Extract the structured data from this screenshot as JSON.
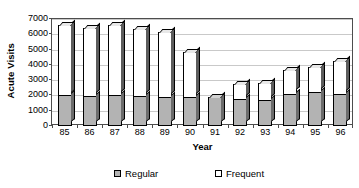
{
  "chart_data": {
    "type": "bar",
    "subtype": "stacked-column-3d",
    "title": "",
    "xlabel": "Year",
    "ylabel": "Acute Visits",
    "categories": [
      "85",
      "86",
      "87",
      "88",
      "89",
      "90",
      "91",
      "92",
      "93",
      "94",
      "95",
      "96"
    ],
    "series": [
      {
        "name": "Regular",
        "color": "#b3b3b3",
        "values": [
          2000,
          1950,
          2000,
          1950,
          1900,
          1900,
          1900,
          1750,
          1700,
          2100,
          2200,
          2100
        ]
      },
      {
        "name": "Frequent",
        "color": "#ffffff",
        "values": [
          4700,
          4500,
          4650,
          4450,
          4300,
          3000,
          0,
          1050,
          1200,
          1600,
          1700,
          2200
        ]
      }
    ],
    "totals": [
      6700,
      6450,
      6650,
      6400,
      6200,
      4900,
      1900,
      2800,
      2900,
      3700,
      3900,
      4300
    ],
    "ylim": [
      0,
      7000
    ],
    "yticks": [
      0,
      1000,
      2000,
      3000,
      4000,
      5000,
      6000,
      7000
    ],
    "ytick_labels": [
      "0",
      "1000",
      "2000",
      "3000",
      "4000",
      "5000",
      "6000",
      "7000"
    ],
    "grid": "horizontal",
    "legend_position": "bottom",
    "legend": [
      {
        "label": "Regular",
        "swatch": "gray-filled-square"
      },
      {
        "label": "Frequent",
        "swatch": "white-empty-square"
      }
    ]
  },
  "axes": {
    "y_title": "Acute Visits",
    "x_title": "Year"
  }
}
